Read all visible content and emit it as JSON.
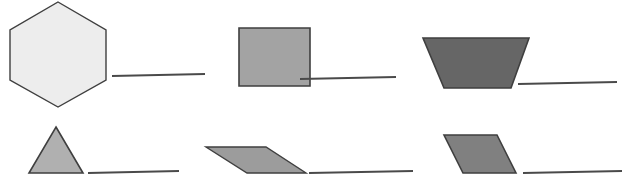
{
  "canvas": {
    "width": 631,
    "height": 186,
    "background": "#ffffff",
    "title": "shape and line size comparison figure"
  },
  "palette": {
    "hexagon_fill": "#ededed",
    "square_fill": "#a3a3a3",
    "trapezoid_fill": "#666666",
    "triangle_fill": "#b0b0b0",
    "thin_parallelogram_fill": "#9c9c9c",
    "parallelogram_fill": "#808080",
    "shape_stroke": "#3f3f3f",
    "line_stroke": "#4a4a4a"
  },
  "items": [
    {
      "id": "pair-1",
      "shape": {
        "name": "hexagon",
        "kind": "polygon",
        "fill": "#ededed",
        "stroke": "#3f3f3f",
        "stroke_width": 1.4,
        "points": "58,2 106,30 106,80 58,107 10,80 10,30"
      },
      "line": {
        "name": "line-segment-1",
        "x1": 112,
        "y1": 76,
        "x2": 205,
        "y2": 74,
        "stroke": "#4a4a4a",
        "stroke_width": 2.2,
        "length_px": 93
      }
    },
    {
      "id": "pair-2",
      "shape": {
        "name": "square",
        "kind": "polygon",
        "fill": "#a3a3a3",
        "stroke": "#3f3f3f",
        "stroke_width": 1.6,
        "points": "239,28 310,28 310,86 239,86"
      },
      "line": {
        "name": "line-segment-2",
        "x1": 300,
        "y1": 79,
        "x2": 396,
        "y2": 77,
        "stroke": "#4a4a4a",
        "stroke_width": 2.2,
        "length_px": 96
      }
    },
    {
      "id": "pair-3",
      "shape": {
        "name": "trapezoid",
        "kind": "polygon",
        "fill": "#666666",
        "stroke": "#3f3f3f",
        "stroke_width": 1.6,
        "points": "423,38 529,38 511,88 444,88"
      },
      "line": {
        "name": "line-segment-3",
        "x1": 518,
        "y1": 84,
        "x2": 617,
        "y2": 82,
        "stroke": "#4a4a4a",
        "stroke_width": 2.2,
        "length_px": 99
      }
    },
    {
      "id": "pair-4",
      "shape": {
        "name": "triangle",
        "kind": "polygon",
        "fill": "#b0b0b0",
        "stroke": "#3f3f3f",
        "stroke_width": 1.6,
        "points": "56,127 83,173 29,173"
      },
      "line": {
        "name": "line-segment-4",
        "x1": 88,
        "y1": 173,
        "x2": 179,
        "y2": 171,
        "stroke": "#4a4a4a",
        "stroke_width": 2.2,
        "length_px": 91
      }
    },
    {
      "id": "pair-5",
      "shape": {
        "name": "thin-parallelogram",
        "kind": "polygon",
        "fill": "#9c9c9c",
        "stroke": "#3f3f3f",
        "stroke_width": 1.4,
        "points": "206,147 266,147 306,173 247,173"
      },
      "line": {
        "name": "line-segment-5",
        "x1": 309,
        "y1": 173,
        "x2": 413,
        "y2": 171,
        "stroke": "#4a4a4a",
        "stroke_width": 2.2,
        "length_px": 104
      }
    },
    {
      "id": "pair-6",
      "shape": {
        "name": "parallelogram",
        "kind": "polygon",
        "fill": "#808080",
        "stroke": "#3f3f3f",
        "stroke_width": 1.6,
        "points": "444,135 497,135 516,173 463,173"
      },
      "line": {
        "name": "line-segment-6",
        "x1": 523,
        "y1": 173,
        "x2": 622,
        "y2": 171,
        "stroke": "#4a4a4a",
        "stroke_width": 2.2,
        "length_px": 99
      }
    }
  ]
}
